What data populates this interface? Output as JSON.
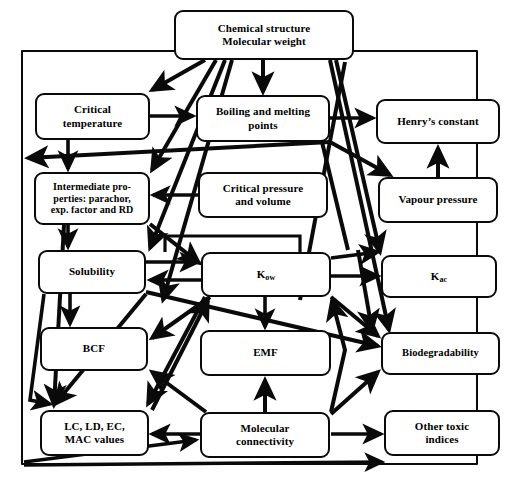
{
  "diagram": {
    "line_color": "#0a0a0a",
    "background": "#ffffff",
    "nodes": [
      {
        "id": "chemical-structure",
        "label": "Chemical structure\nMolecular weight",
        "x": 174,
        "y": 10,
        "w": 180,
        "h": 50
      },
      {
        "id": "critical-temperature",
        "label": "Critical\ntemperature",
        "x": 35,
        "y": 93,
        "w": 115,
        "h": 47
      },
      {
        "id": "boiling-melting",
        "label": "Boiling and melting\npoints",
        "x": 196,
        "y": 95,
        "w": 134,
        "h": 47
      },
      {
        "id": "henrys-constant",
        "label": "Henry’s constant",
        "x": 376,
        "y": 99,
        "w": 124,
        "h": 45
      },
      {
        "id": "intermediate-properties",
        "label": "Intermediate pro-\nperties: parachor,\nexp. factor and RD",
        "x": 34,
        "y": 172,
        "w": 116,
        "h": 53
      },
      {
        "id": "critical-pressure",
        "label": "Critical pressure\nand volume",
        "x": 198,
        "y": 172,
        "w": 130,
        "h": 46
      },
      {
        "id": "vapour-pressure",
        "label": "Vapour pressure",
        "x": 378,
        "y": 177,
        "w": 120,
        "h": 46
      },
      {
        "id": "solubility",
        "label": "Solubility",
        "x": 38,
        "y": 250,
        "w": 108,
        "h": 44
      },
      {
        "id": "kow",
        "label": "K",
        "sub": "ow",
        "x": 201,
        "y": 252,
        "w": 130,
        "h": 45
      },
      {
        "id": "kac",
        "label": "K",
        "sub": "ac",
        "x": 381,
        "y": 255,
        "w": 116,
        "h": 43
      },
      {
        "id": "bcf",
        "label": "BCF",
        "x": 40,
        "y": 327,
        "w": 108,
        "h": 44
      },
      {
        "id": "emf",
        "label": "EMF",
        "x": 200,
        "y": 330,
        "w": 131,
        "h": 46
      },
      {
        "id": "biodegradability",
        "label": "Biodegradability",
        "x": 381,
        "y": 332,
        "w": 119,
        "h": 43
      },
      {
        "id": "lc-ld-ec",
        "label": "LC, LD, EC,\nMAC values",
        "x": 40,
        "y": 410,
        "w": 109,
        "h": 46
      },
      {
        "id": "molecular-connectivity",
        "label": "Molecular\nconnectivity",
        "x": 200,
        "y": 412,
        "w": 130,
        "h": 46
      },
      {
        "id": "other-toxic",
        "label": "Other toxic\nindices",
        "x": 384,
        "y": 410,
        "w": 116,
        "h": 46
      }
    ],
    "outer_frame": {
      "x": 21,
      "y": 50,
      "w": 457,
      "h": 415
    }
  }
}
